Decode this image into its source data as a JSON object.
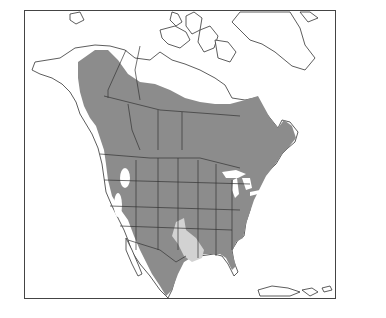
{
  "map": {
    "type": "species-range-map",
    "region": "North America",
    "colors": {
      "background": "#ffffff",
      "outline": "#333333",
      "range_primary": "#8c8c8c",
      "range_secondary": "#d2d2d2"
    },
    "legend": "none",
    "labels": []
  }
}
